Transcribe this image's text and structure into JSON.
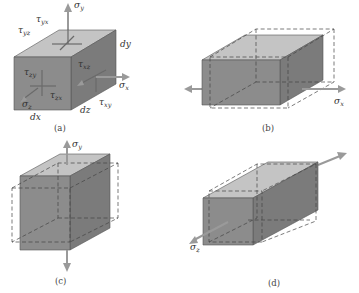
{
  "figure": {
    "panels": [
      {
        "id": "a",
        "caption": "(a)",
        "labels": {
          "sigma_y": "σ",
          "sigma_y_sub": "y",
          "sigma_x": "σ",
          "sigma_x_sub": "x",
          "sigma_z": "σ",
          "sigma_z_sub": "z",
          "tau_yx": "τ",
          "tau_yx_sub": "yx",
          "tau_yz": "τ",
          "tau_yz_sub": "yz",
          "tau_zy": "τ",
          "tau_zy_sub": "zy",
          "tau_zx": "τ",
          "tau_zx_sub": "zx",
          "tau_xz": "τ",
          "tau_xz_sub": "xz",
          "tau_xy": "τ",
          "tau_xy_sub": "xy",
          "dx": "dx",
          "dy": "dy",
          "dz": "dz"
        }
      },
      {
        "id": "b",
        "caption": "(b)",
        "labels": {
          "sigma": "σ",
          "sigma_sub": "x"
        }
      },
      {
        "id": "c",
        "caption": "(c)",
        "labels": {
          "sigma": "σ",
          "sigma_sub": "y"
        }
      },
      {
        "id": "d",
        "caption": "(d)",
        "labels": {
          "sigma": "σ",
          "sigma_sub": "z"
        }
      }
    ],
    "colors": {
      "front_face": "#8c8c8c",
      "side_face": "#7b7b7b",
      "top_face": "#c4c4c4",
      "arrow": "#9a9a9a"
    }
  }
}
